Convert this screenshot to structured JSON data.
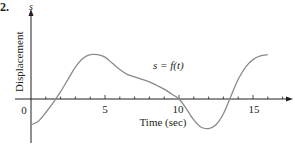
{
  "problem_number": "2.",
  "chart_data": {
    "type": "line",
    "title": "",
    "xlabel": "Time (sec)",
    "ylabel": "Displacement",
    "y_axis_symbol": "s",
    "curve_label": "s = f(t)",
    "x_ticks": [
      0,
      5,
      10,
      15
    ],
    "x_tick_labels": [
      "0",
      "5",
      "10",
      "15"
    ],
    "x_minor_tick_step": 1,
    "xlim": [
      -1,
      17.5
    ],
    "ylim": [
      -3,
      6
    ],
    "grid": false,
    "legend": "none",
    "series": [
      {
        "name": "s = f(t)",
        "x": [
          0,
          0.5,
          1,
          1.5,
          2,
          2.5,
          3,
          3.5,
          4,
          4.5,
          5,
          5.5,
          6,
          6.5,
          7,
          7.5,
          8,
          8.5,
          9,
          9.5,
          10,
          10.5,
          11,
          11.5,
          12,
          12.5,
          13,
          13.5,
          14,
          14.5,
          15,
          15.5,
          16
        ],
        "values": [
          -2.1,
          -1.8,
          -1.1,
          -0.3,
          0.6,
          1.6,
          2.6,
          3.3,
          3.6,
          3.6,
          3.4,
          2.9,
          2.4,
          2.0,
          1.8,
          1.6,
          1.4,
          1.1,
          0.8,
          0.4,
          0,
          -0.8,
          -1.7,
          -2.3,
          -2.4,
          -2.1,
          -1.2,
          0.2,
          1.6,
          2.6,
          3.2,
          3.5,
          3.6
        ]
      }
    ]
  },
  "colors": {
    "curve": "#8a8a8a",
    "axes": "#231f20",
    "text": "#231f20"
  }
}
